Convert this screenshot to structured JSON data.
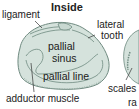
{
  "title": "Inside",
  "labels": {
    "ligament": "ligament",
    "lateral_tooth_1": "lateral",
    "lateral_tooth_2": "tooth",
    "pallial_sinus_1": "pallial",
    "pallial_sinus_2": "sinus",
    "pallial_line": "pallial line",
    "adductor_muscle": "adductor muscle",
    "scales": "scales",
    "partial_label": "ra"
  },
  "colors": {
    "shell_fill": "#d5e2dc",
    "shell_stroke": "#6f8a80",
    "text": "#222222"
  }
}
